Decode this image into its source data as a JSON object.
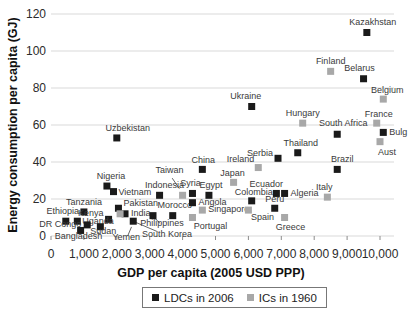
{
  "chart_data": {
    "type": "scatter",
    "title": "",
    "xlabel": "GDP per capita (2005 USD PPP)",
    "ylabel": "Energy consumption per capita (GJ)",
    "xlim": [
      0,
      10400
    ],
    "ylim": [
      0,
      120
    ],
    "grid": "horizontal",
    "legend_position": "bottom-center",
    "x_tick_values": [
      0,
      1000,
      2000,
      3000,
      4000,
      5000,
      6000,
      7000,
      8000,
      9000,
      10000
    ],
    "x_tick_labels": [
      "0",
      "1,000",
      "2,000",
      "3,000",
      "4,000",
      "5,000",
      "6,000",
      "7,000",
      "8,000",
      "9,000",
      "10,000"
    ],
    "y_tick_values": [
      0,
      20,
      40,
      60,
      80,
      100,
      120
    ],
    "y_tick_labels": [
      "0",
      "20",
      "40",
      "60",
      "80",
      "100",
      "120"
    ],
    "series": [
      {
        "name": "LDCs in 2006",
        "color": "#1a1a1a",
        "points": [
          {
            "label": "Kazakhstan",
            "x": 9600,
            "y": 110,
            "lp": [
              6,
              -8,
              "mid"
            ]
          },
          {
            "label": "Belarus",
            "x": 9500,
            "y": 85,
            "lp": [
              -4,
              -8,
              "mid"
            ]
          },
          {
            "label": "Ukraine",
            "x": 6100,
            "y": 70,
            "lp": [
              -6,
              -8,
              "mid"
            ]
          },
          {
            "label": "Uzbekistan",
            "x": 2000,
            "y": 53,
            "lp": [
              11,
              -7,
              "mid"
            ]
          },
          {
            "label": "South Africa",
            "x": 8700,
            "y": 55,
            "lp": [
              6,
              -8,
              "mid"
            ]
          },
          {
            "label": "Bulg",
            "x": 10100,
            "y": 56,
            "lp": [
              6,
              3,
              "start"
            ]
          },
          {
            "label": "Thailand",
            "x": 7500,
            "y": 45,
            "lp": [
              3,
              -7,
              "mid"
            ]
          },
          {
            "label": "Serbia",
            "x": 6900,
            "y": 42,
            "lp": [
              -5,
              -2,
              "end"
            ]
          },
          {
            "label": "Brazil",
            "x": 8700,
            "y": 36,
            "lp": [
              5,
              -7,
              "mid"
            ]
          },
          {
            "label": "China",
            "x": 4600,
            "y": 36,
            "lp": [
              1,
              -6,
              "mid"
            ]
          },
          {
            "label": "Syria",
            "x": 4300,
            "y": 23,
            "lp": [
              -2,
              -7,
              "mid"
            ]
          },
          {
            "label": "Egypt",
            "x": 4800,
            "y": 22,
            "lp": [
              2,
              -7,
              "mid"
            ]
          },
          {
            "label": "Nigeria",
            "x": 1700,
            "y": 27,
            "lp": [
              4,
              -7,
              "mid"
            ]
          },
          {
            "label": "Vietnam",
            "x": 1900,
            "y": 24,
            "lp": [
              5,
              3,
              "start"
            ]
          },
          {
            "label": "Indonesia",
            "x": 3300,
            "y": 22,
            "lp": [
              5,
              -7,
              "mid"
            ]
          },
          {
            "label": "Pakistan",
            "x": 2050,
            "y": 15,
            "lp": [
              5,
              -2,
              "start"
            ]
          },
          {
            "label": "India",
            "x": 2250,
            "y": 12,
            "lp": [
              6,
              2,
              "start"
            ]
          },
          {
            "label": "Morocco",
            "x": 3700,
            "y": 11,
            "lp": [
              2,
              -8,
              "mid"
            ]
          },
          {
            "label": "Philippines",
            "x": 3100,
            "y": 11,
            "lp": [
              9,
              10,
              "mid",
              "leader"
            ]
          },
          {
            "label": "Yemen",
            "x": 2500,
            "y": 8,
            "lp": [
              -7,
              19,
              "mid",
              "leader"
            ]
          },
          {
            "label": "Tanzania",
            "x": 1000,
            "y": 13,
            "lp": [
              0,
              -7,
              "mid"
            ]
          },
          {
            "label": "Kenya",
            "x": 1750,
            "y": 9,
            "lp": [
              -5,
              -3,
              "end"
            ]
          },
          {
            "label": "Ethiopia",
            "x": 450,
            "y": 8,
            "lp": [
              -3,
              -7,
              "mid"
            ]
          },
          {
            "label": "Uganda",
            "x": 800,
            "y": 8,
            "lp": [
              5,
              3,
              "start"
            ]
          },
          {
            "label": "DR Congo",
            "x": 1100,
            "y": 6,
            "lp": [
              -6,
              2,
              "end"
            ]
          },
          {
            "label": "Sudan",
            "x": 1500,
            "y": 5,
            "lp": [
              3,
              7,
              "mid"
            ]
          },
          {
            "label": "Bangladesh",
            "x": 900,
            "y": 3,
            "lp": [
              -2,
              9,
              "mid"
            ]
          },
          {
            "label": "Angola",
            "x": 4300,
            "y": 18,
            "lp": [
              6,
              2,
              "start"
            ]
          },
          {
            "label": "Colombia",
            "x": 6100,
            "y": 19,
            "lp": [
              2,
              -6,
              "mid"
            ]
          },
          {
            "label": "Ecuador",
            "x": 6850,
            "y": 23,
            "lp": [
              -10,
              -6,
              "mid"
            ]
          },
          {
            "label": "Algeria",
            "x": 7100,
            "y": 23,
            "lp": [
              6,
              3,
              "start"
            ]
          },
          {
            "label": "Peru",
            "x": 6800,
            "y": 15,
            "lp": [
              0,
              -6,
              "mid"
            ]
          }
        ]
      },
      {
        "name": "ICs in 1960",
        "color": "#a8a8a8",
        "points": [
          {
            "label": "Finland",
            "x": 8500,
            "y": 89,
            "lp": [
              0,
              -7,
              "mid"
            ]
          },
          {
            "label": "Belgium",
            "x": 10100,
            "y": 74,
            "lp": [
              4,
              -6,
              "mid"
            ]
          },
          {
            "label": "France",
            "x": 9900,
            "y": 61,
            "lp": [
              2,
              -6,
              "mid"
            ]
          },
          {
            "label": "Hungary",
            "x": 7650,
            "y": 61,
            "lp": [
              0,
              -7,
              "mid"
            ]
          },
          {
            "label": "Aust",
            "x": 10000,
            "y": 51,
            "lp": [
              7,
              13,
              "mid"
            ]
          },
          {
            "label": "Ireland",
            "x": 6300,
            "y": 37,
            "lp": [
              -4,
              -6,
              "end"
            ]
          },
          {
            "label": "Japan",
            "x": 5550,
            "y": 29,
            "lp": [
              -1,
              -6,
              "mid"
            ]
          },
          {
            "label": "Italy",
            "x": 8400,
            "y": 21,
            "lp": [
              -3,
              -7,
              "mid"
            ]
          },
          {
            "label": "Taiwan",
            "x": 4000,
            "y": 22,
            "lp": [
              -13,
              -22,
              "mid",
              "leader"
            ]
          },
          {
            "label": "Singapore",
            "x": 4600,
            "y": 14,
            "lp": [
              6,
              2,
              "start"
            ]
          },
          {
            "label": "Portugal",
            "x": 4300,
            "y": 10,
            "lp": [
              18,
              11,
              "mid"
            ]
          },
          {
            "label": "Spain",
            "x": 6000,
            "y": 14,
            "lp": [
              14,
              10,
              "mid"
            ]
          },
          {
            "label": "Greece",
            "x": 7100,
            "y": 10,
            "lp": [
              6,
              12,
              "mid"
            ]
          },
          {
            "label": "South Korea",
            "x": 2100,
            "y": 12,
            "lp": [
              47,
              23,
              "mid",
              "leader"
            ]
          }
        ]
      }
    ]
  },
  "colors": {
    "grid": "#d9d9d9",
    "tick_mark": "#8c8c8c",
    "tick_text": "#2b2b2b",
    "point_label_text": "#3a3a3a",
    "leader_line": "#555555",
    "legend_border": "#777777",
    "background": "#ffffff"
  }
}
